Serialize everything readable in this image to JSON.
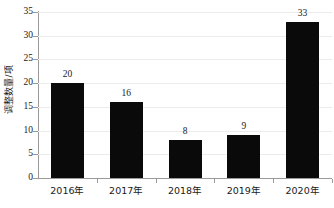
{
  "chart_data": {
    "type": "bar",
    "title": "",
    "xlabel": "",
    "ylabel": "调整数量/项",
    "categories": [
      "2016年",
      "2017年",
      "2018年",
      "2019年",
      "2020年"
    ],
    "values": [
      20,
      16,
      8,
      9,
      33
    ],
    "data_labels": [
      "20",
      "16",
      "8",
      "9",
      "33"
    ],
    "ylim": [
      0,
      35
    ],
    "ytick_values": [
      0,
      5,
      10,
      15,
      20,
      25,
      30,
      35
    ],
    "ytick_labels": [
      "0",
      "5",
      "10",
      "15",
      "20",
      "25",
      "30",
      "35"
    ],
    "grid": "horizontal",
    "legend": "none",
    "bar_color": "#0a0a0a",
    "gridline_color": "#ececec",
    "axis_color": "#9a9a9a",
    "background_color": "#ffffff"
  }
}
